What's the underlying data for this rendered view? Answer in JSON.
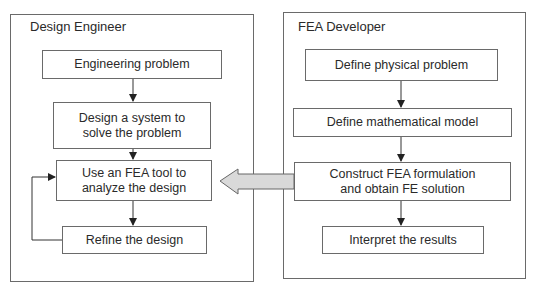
{
  "panels": {
    "left": {
      "title": "Design Engineer",
      "steps": [
        "Engineering problem",
        "Design a system to\nsolve the problem",
        "Use an FEA tool to\nanalyze the design",
        "Refine the design"
      ]
    },
    "right": {
      "title": "FEA Developer",
      "steps": [
        "Define physical problem",
        "Define mathematical model",
        "Construct FEA formulation\nand obtain FE solution",
        "Interpret the results"
      ]
    }
  },
  "connectors": {
    "feedback_loop": "Refine the design -> Use an FEA tool to analyze the design",
    "cross_panel_arrow": "FEA Developer -> Use an FEA tool to analyze the design",
    "cross_panel_arrow_color": "#d9d9d9",
    "line_color": "#333333"
  }
}
